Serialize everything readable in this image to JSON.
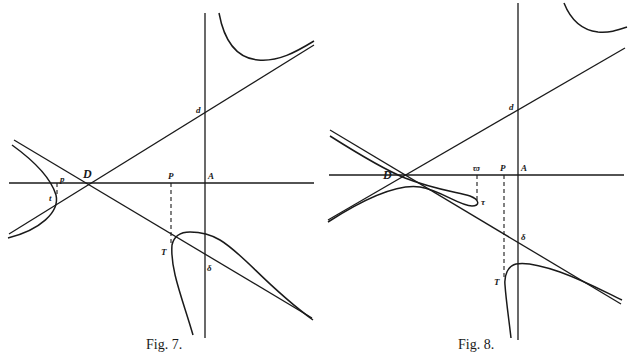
{
  "figures": [
    {
      "id": "fig7",
      "caption": "Fig. 7.",
      "labels": {
        "D": "D",
        "d": "d",
        "P": "P",
        "A": "A",
        "p": "p",
        "t": "t",
        "T": "T",
        "delta": "δ"
      }
    },
    {
      "id": "fig8",
      "caption": "Fig. 8.",
      "labels": {
        "D": "D",
        "d": "d",
        "P": "P",
        "A": "A",
        "w": "ϖ",
        "r": "τ",
        "T": "T",
        "delta": "δ"
      }
    }
  ]
}
